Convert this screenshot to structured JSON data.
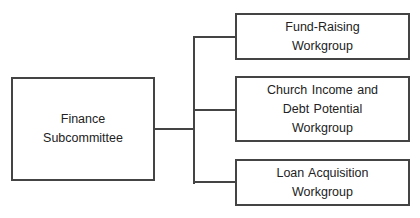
{
  "diagram": {
    "type": "org-chart",
    "title_partially_visible": true,
    "colors": {
      "line": "#444444",
      "text": "#222222",
      "background": "#ffffff"
    },
    "root": {
      "label": "Finance\nSubcommittee"
    },
    "children": [
      {
        "label": "Fund-Raising\nWorkgroup"
      },
      {
        "label": "Church Income and\nDebt Potential\nWorkgroup"
      },
      {
        "label": "Loan Acquisition\nWorkgroup"
      }
    ]
  }
}
